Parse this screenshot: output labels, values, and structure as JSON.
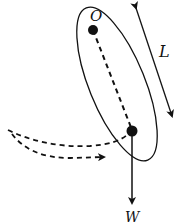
{
  "diagram": {
    "type": "pendulum-physics-figure",
    "labels": {
      "pivot": "O",
      "length": "L",
      "weight": "W"
    },
    "colors": {
      "stroke": "#111111",
      "background": "#ffffff"
    },
    "elements": [
      {
        "name": "trajectory-ellipse",
        "description": "tilted closed orbit of the bob"
      },
      {
        "name": "pivot-point",
        "label": "O"
      },
      {
        "name": "dashed-string",
        "description": "dashed line from pivot O to bob"
      },
      {
        "name": "bob",
        "description": "mass at end of pendulum"
      },
      {
        "name": "length-arrow",
        "label": "L",
        "description": "double-headed arrow indicating length"
      },
      {
        "name": "weight-arrow",
        "label": "W",
        "description": "downward force vector"
      },
      {
        "name": "motion-curves",
        "description": "two dashed curved paths from left, lower with arrowhead"
      }
    ]
  }
}
